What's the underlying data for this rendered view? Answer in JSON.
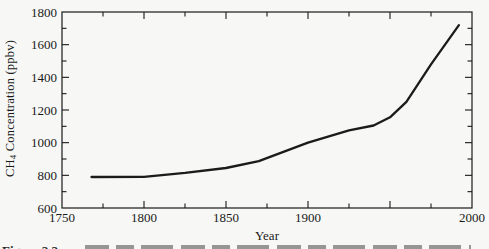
{
  "figure": {
    "y_axis_label_prefix": "CH",
    "y_axis_label_sub": "4",
    "y_axis_label_suffix": " Concentration (ppbv)",
    "x_axis_label": "Year",
    "caption_label": "Figure 2.2"
  },
  "chart_data": {
    "type": "line",
    "title": "",
    "xlabel": "Year",
    "ylabel": "CH4 Concentration (ppbv)",
    "xlim": [
      1750,
      2000
    ],
    "ylim": [
      600,
      1800
    ],
    "grid": false,
    "legend": null,
    "frame": "full-box",
    "ticks_direction": "in",
    "x_tick_labels": [
      {
        "value": 1750,
        "label": "1750"
      },
      {
        "value": 1800,
        "label": "1800"
      },
      {
        "value": 1850,
        "label": "1850"
      },
      {
        "value": 1900,
        "label": "1900"
      },
      {
        "value": 2000,
        "label": "2000"
      }
    ],
    "x_major_ticks": [
      1800,
      1850,
      1900,
      1950
    ],
    "x_minor_ticks": [
      1775,
      1825,
      1875,
      1925,
      1975
    ],
    "y_tick_labels": [
      {
        "value": 600,
        "label": "600"
      },
      {
        "value": 800,
        "label": "800"
      },
      {
        "value": 1000,
        "label": "1000"
      },
      {
        "value": 1200,
        "label": "1200"
      },
      {
        "value": 1400,
        "label": "1400"
      },
      {
        "value": 1600,
        "label": "1600"
      },
      {
        "value": 1800,
        "label": "1800"
      }
    ],
    "y_major_ticks": [
      800,
      1000,
      1200,
      1400,
      1600
    ],
    "y_minor_ticks": [
      700,
      900,
      1100,
      1300,
      1500,
      1700
    ],
    "series": [
      {
        "name": "CH4 atmospheric concentration",
        "x": [
          1768,
          1800,
          1825,
          1850,
          1870,
          1900,
          1925,
          1940,
          1950,
          1960,
          1975,
          1992
        ],
        "y": [
          790,
          791,
          815,
          845,
          887,
          1000,
          1075,
          1105,
          1155,
          1250,
          1480,
          1720
        ]
      }
    ],
    "line_color": "#1b1b1b",
    "axis_color": "#1a1a1a",
    "background_color": "#f7f7f5"
  }
}
